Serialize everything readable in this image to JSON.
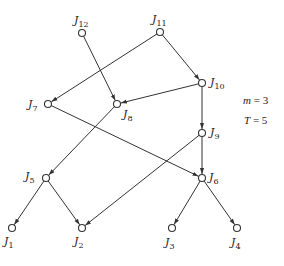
{
  "diagram": {
    "type": "directed-graph",
    "nodes": [
      {
        "id": "J1",
        "name": "J",
        "sub": "1",
        "x": 12,
        "y": 228,
        "lx": 4,
        "ly": 236
      },
      {
        "id": "J2",
        "name": "J",
        "sub": "2",
        "x": 82,
        "y": 228,
        "lx": 74,
        "ly": 236
      },
      {
        "id": "J3",
        "name": "J",
        "sub": "3",
        "x": 172,
        "y": 228,
        "lx": 165,
        "ly": 237
      },
      {
        "id": "J4",
        "name": "J",
        "sub": "4",
        "x": 237,
        "y": 228,
        "lx": 231,
        "ly": 237
      },
      {
        "id": "J5",
        "name": "J",
        "sub": "5",
        "x": 46,
        "y": 178,
        "lx": 25,
        "ly": 171
      },
      {
        "id": "J6",
        "name": "J",
        "sub": "6",
        "x": 202,
        "y": 178,
        "lx": 209,
        "ly": 172
      },
      {
        "id": "J7",
        "name": "J",
        "sub": "7",
        "x": 48,
        "y": 104,
        "lx": 28,
        "ly": 99
      },
      {
        "id": "J8",
        "name": "J",
        "sub": "8",
        "x": 117,
        "y": 104,
        "lx": 123,
        "ly": 109
      },
      {
        "id": "J9",
        "name": "J",
        "sub": "9",
        "x": 202,
        "y": 133,
        "lx": 210,
        "ly": 127
      },
      {
        "id": "J10",
        "name": "J",
        "sub": "10",
        "x": 202,
        "y": 83,
        "lx": 210,
        "ly": 77
      },
      {
        "id": "J11",
        "name": "J",
        "sub": "11",
        "x": 160,
        "y": 32,
        "lx": 152,
        "ly": 14
      },
      {
        "id": "J12",
        "name": "J",
        "sub": "12",
        "x": 82,
        "y": 33,
        "lx": 74,
        "ly": 15
      }
    ],
    "edges": [
      {
        "from": "J12",
        "to": "J8"
      },
      {
        "from": "J11",
        "to": "J7"
      },
      {
        "from": "J11",
        "to": "J10"
      },
      {
        "from": "J10",
        "to": "J8"
      },
      {
        "from": "J10",
        "to": "J9"
      },
      {
        "from": "J8",
        "to": "J5"
      },
      {
        "from": "J7",
        "to": "J6"
      },
      {
        "from": "J9",
        "to": "J2"
      },
      {
        "from": "J9",
        "to": "J6"
      },
      {
        "from": "J5",
        "to": "J1"
      },
      {
        "from": "J5",
        "to": "J2"
      },
      {
        "from": "J6",
        "to": "J3"
      },
      {
        "from": "J6",
        "to": "J4"
      }
    ],
    "parameters": [
      {
        "var": "m",
        "value": "3",
        "text": "= 3",
        "x": 243,
        "y": 101
      },
      {
        "var": "T",
        "value": "5",
        "text": "= 5",
        "x": 244,
        "y": 121
      }
    ],
    "style": {
      "stroke": "#333333",
      "node_fill": "#ffffff",
      "node_radius": 3.5
    }
  }
}
